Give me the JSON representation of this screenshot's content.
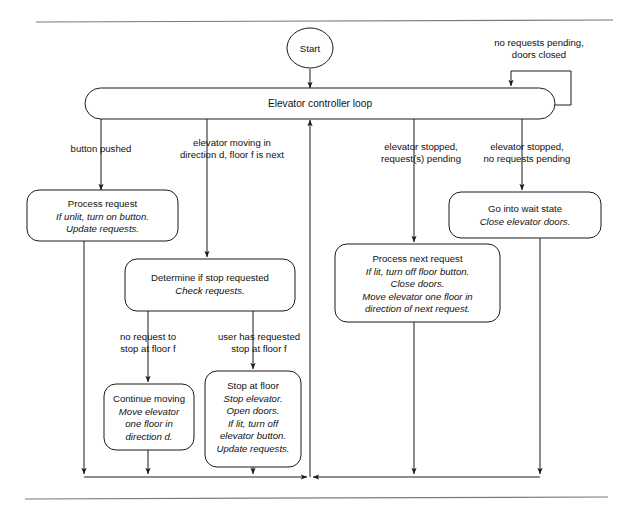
{
  "diagram": {
    "title_label": "Elevator controller loop",
    "start_label": "Start",
    "nodes": {
      "start": {
        "name": "start-node",
        "label": "Start"
      },
      "loop": {
        "name": "elevator-controller-loop",
        "label": "Elevator controller loop"
      },
      "process_request": {
        "name": "process-request-node",
        "title": "Process request",
        "details": [
          "If unlit, turn on button.",
          "Update requests."
        ]
      },
      "determine_stop": {
        "name": "determine-if-stop-requested-node",
        "title": "Determine if stop requested",
        "details": [
          "Check requests."
        ]
      },
      "process_next_request": {
        "name": "process-next-request-node",
        "title": "Process next request",
        "details": [
          "If lit, turn off floor button.",
          "Close doors.",
          "Move elevator one floor in",
          "direction of next request."
        ]
      },
      "wait_state": {
        "name": "go-into-wait-state-node",
        "title": "Go into wait state",
        "details": [
          "Close elevator doors."
        ]
      },
      "continue_moving": {
        "name": "continue-moving-node",
        "title": "Continue moving",
        "details": [
          "Move elevator",
          "one floor in",
          "direction d."
        ]
      },
      "stop_at_floor": {
        "name": "stop-at-floor-node",
        "title": "Stop at floor",
        "details": [
          "Stop elevator.",
          "Open doors.",
          "If lit, turn off",
          "elevator button.",
          "Update requests."
        ]
      }
    },
    "edge_labels": {
      "self_loop": [
        "no requests pending,",
        "doors closed"
      ],
      "button_pushed": [
        "button pushed"
      ],
      "elevator_moving": [
        "elevator moving in",
        "direction d, floor f is next"
      ],
      "stopped_pending": [
        "elevator stopped,",
        "request(s) pending"
      ],
      "stopped_no_pending": [
        "elevator stopped,",
        "no requests pending"
      ],
      "no_request_stop": [
        "no request to",
        "stop at floor f"
      ],
      "user_requested_stop": [
        "user has requested",
        "stop at floor f"
      ]
    },
    "colors": {
      "stroke": "#1a1a1a",
      "text": "#111111",
      "rule": "#7a7a7a",
      "background": "#ffffff"
    }
  }
}
